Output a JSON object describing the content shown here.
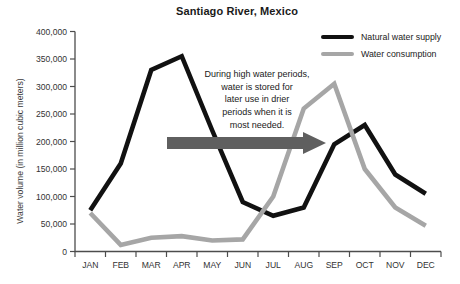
{
  "chart_data": {
    "type": "line",
    "title": "Santiago River, Mexico",
    "xlabel": "",
    "ylabel": "Water volume (in million cubic meters)",
    "categories": [
      "JAN",
      "FEB",
      "MAR",
      "APR",
      "MAY",
      "JUN",
      "JUL",
      "AUG",
      "SEP",
      "OCT",
      "NOV",
      "DEC"
    ],
    "ylim": [
      0,
      400000
    ],
    "ytick_step": 50000,
    "grid": false,
    "legend_position": "top-right",
    "series": [
      {
        "name": "Natural water supply",
        "color": "#111111",
        "values": [
          75000,
          160000,
          330000,
          355000,
          220000,
          90000,
          65000,
          80000,
          195000,
          230000,
          140000,
          105000
        ]
      },
      {
        "name": "Water consumption",
        "color": "#a6a6a6",
        "values": [
          70000,
          12000,
          25000,
          28000,
          20000,
          22000,
          100000,
          260000,
          305000,
          150000,
          80000,
          47000
        ]
      }
    ],
    "annotation": {
      "text": "During high water periods,\nwater is stored for\nlater use in drier\nperiods when it is\nmost needed.",
      "arrow_color": "#5f5f5f"
    }
  },
  "colors": {
    "background": "#ffffff",
    "axis": "#4d4d4d",
    "tick_text": "#333333"
  }
}
